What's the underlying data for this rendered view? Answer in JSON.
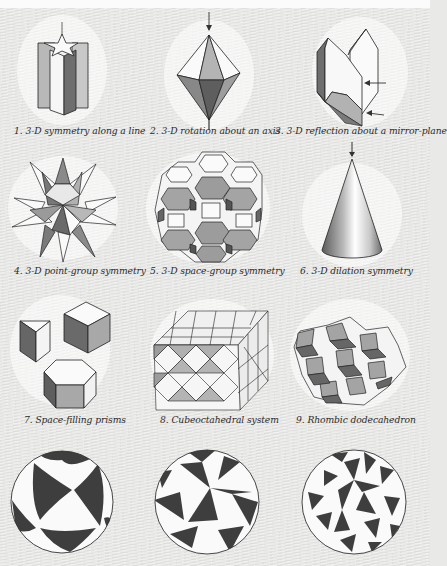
{
  "figures": [
    {
      "number": "1.",
      "caption": "3-D symmetry along a line"
    },
    {
      "number": "2.",
      "caption": "3-D rotation about an axis"
    },
    {
      "number": "3.",
      "caption": "3-D reflection about a mirror-plane"
    },
    {
      "number": "4.",
      "caption": "3-D point-group symmetry"
    },
    {
      "number": "5.",
      "caption": "3-D space-group symmetry"
    },
    {
      "number": "6.",
      "caption": "3-D dilation symmetry"
    },
    {
      "number": "7.",
      "caption": "Space-filling prisms"
    },
    {
      "number": "8.",
      "caption": "Cubeoctahedral system"
    },
    {
      "number": "9.",
      "caption": "Rhombic dodecahedron"
    },
    {
      "number": "10.",
      "caption": ""
    },
    {
      "number": "11.",
      "caption": ""
    },
    {
      "number": "12.",
      "caption": ""
    }
  ],
  "captions_full": [
    "1. 3-D symmetry along a line",
    "2. 3-D rotation about an axis",
    "3. 3-D reflection about a mirror-plane",
    "4. 3-D point-group symmetry",
    "5. 3-D space-group symmetry",
    "6. 3-D dilation symmetry",
    "7. Space-filling prisms",
    "8. Cubeoctahedral system",
    "9. Rhombic dodecahedron"
  ],
  "colors": {
    "paper": "#e6e6e4",
    "ink": "#2a2a2a",
    "shade_dark": "#5a5a5a",
    "shade_mid": "#9a9a9a",
    "shade_light": "#c4c4c4"
  }
}
